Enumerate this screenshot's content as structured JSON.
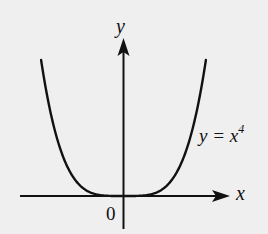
{
  "chart_data": {
    "type": "line",
    "title": "",
    "xlabel": "x",
    "ylabel": "y",
    "origin_label": "0",
    "series": [
      {
        "name": "y = x^4",
        "label_text": {
          "prefix": "y = x",
          "exponent": "4"
        },
        "function": "x^4",
        "x": [
          -2,
          -1.75,
          -1.5,
          -1.25,
          -1,
          -0.75,
          -0.5,
          -0.25,
          0,
          0.25,
          0.5,
          0.75,
          1,
          1.25,
          1.5,
          1.75,
          2
        ],
        "values": [
          16,
          9.38,
          5.06,
          2.44,
          1,
          0.32,
          0.06,
          0.004,
          0,
          0.004,
          0.06,
          0.32,
          1,
          2.44,
          5.06,
          9.38,
          16
        ]
      }
    ],
    "xlim": [
      -2.5,
      2.6
    ],
    "ylim": [
      -3.8,
      18
    ],
    "grid": false,
    "legend": "none",
    "ticks": "none"
  },
  "colors": {
    "background": "#efefef",
    "ink": "#111111"
  }
}
